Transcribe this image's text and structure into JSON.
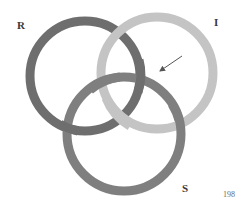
{
  "diagram": {
    "type": "borromean-rings",
    "rings": [
      {
        "id": "R",
        "label": "R",
        "color": "#6e6e6e",
        "cx": 85,
        "cy": 76,
        "r": 55
      },
      {
        "id": "I",
        "label": "I",
        "color": "#c4c4c4",
        "cx": 157,
        "cy": 73,
        "r": 56
      },
      {
        "id": "S",
        "label": "S",
        "color": "#7f7f7f",
        "cx": 124,
        "cy": 134,
        "r": 57
      }
    ],
    "ring_width": 9,
    "arrow": {
      "from": [
        182,
        56
      ],
      "to": [
        158,
        72
      ],
      "color": "#6a6a6a"
    }
  },
  "labels": {
    "R": "R",
    "I": "I",
    "S": "S"
  },
  "page_number": "198"
}
